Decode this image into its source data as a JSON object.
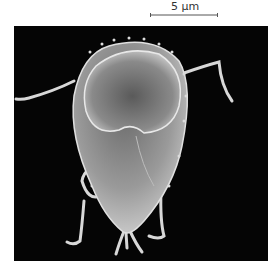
{
  "figure": {
    "scale_bar": {
      "label": "5 µm",
      "color": "#444444"
    },
    "micrograph": {
      "subject": "scanning electron micrograph of a flagellated protist cell (teardrop body with ventral disc and flagella)",
      "background_color": "#050505",
      "specimen_color": "#c8c8c8"
    }
  }
}
